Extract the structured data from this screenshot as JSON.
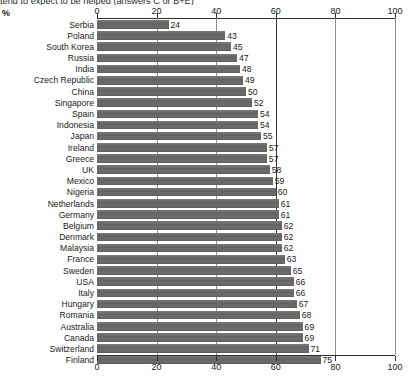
{
  "chart_data": {
    "type": "bar",
    "orientation": "horizontal",
    "title": "tend to expect to be helped (answers C or B+E)",
    "xlabel": "%",
    "ylabel": "",
    "unit_label": "%",
    "xlim": [
      0,
      100
    ],
    "ticks": [
      0,
      20,
      40,
      60,
      80,
      100
    ],
    "grid": true,
    "grid_axis": "x",
    "legend": false,
    "axis_top": true,
    "axis_bottom": true,
    "bar_color": "#696969",
    "categories": [
      "Serbia",
      "Poland",
      "South Korea",
      "Russia",
      "India",
      "Czech Republic",
      "China",
      "Singapore",
      "Spain",
      "Indonesia",
      "Japan",
      "Ireland",
      "Greece",
      "UK",
      "Mexico",
      "Nigeria",
      "Netherlands",
      "Germany",
      "Belgium",
      "Denmark",
      "Malaysia",
      "France",
      "Sweden",
      "USA",
      "Italy",
      "Hungary",
      "Romania",
      "Australia",
      "Canada",
      "Switzerland",
      "Finland"
    ],
    "values": [
      24,
      43,
      45,
      47,
      48,
      49,
      50,
      52,
      54,
      54,
      55,
      57,
      57,
      58,
      59,
      60,
      61,
      61,
      62,
      62,
      62,
      63,
      65,
      66,
      66,
      67,
      68,
      69,
      69,
      71,
      75
    ]
  }
}
